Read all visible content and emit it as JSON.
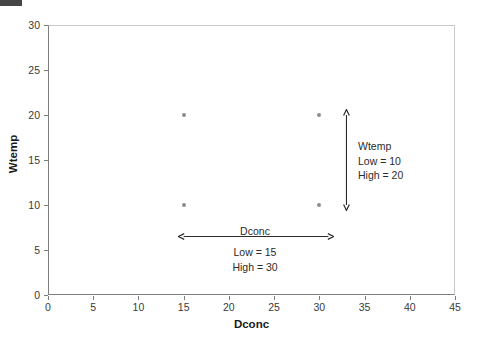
{
  "chart_data": {
    "type": "scatter",
    "title": "",
    "xlabel": "Dconc",
    "ylabel": "Wtemp",
    "xlim": [
      0,
      45
    ],
    "ylim": [
      0,
      30
    ],
    "xticks": [
      0,
      5,
      10,
      15,
      20,
      25,
      30,
      35,
      40,
      45
    ],
    "yticks": [
      0,
      5,
      10,
      15,
      20,
      25,
      30
    ],
    "grid": false,
    "legend": null,
    "marker_color": "#8d8d8d",
    "points": [
      {
        "x": 15,
        "y": 20
      },
      {
        "x": 30,
        "y": 20
      },
      {
        "x": 15,
        "y": 10
      },
      {
        "x": 30,
        "y": 10
      }
    ],
    "annotations": [
      {
        "id": "wtemp-range",
        "orientation": "vertical",
        "arrow_from": {
          "x": 33,
          "y": 20
        },
        "arrow_to": {
          "x": 33,
          "y": 10
        },
        "title": "Wtemp",
        "low_label": "Low = 10",
        "high_label": "High = 20"
      },
      {
        "id": "dconc-range",
        "orientation": "horizontal",
        "arrow_from": {
          "x": 15,
          "y": 6.5
        },
        "arrow_to": {
          "x": 31,
          "y": 6.5
        },
        "title": "Dconc",
        "low_label": "Low = 15",
        "high_label": "High = 30"
      }
    ]
  },
  "axes": {
    "x_title": "Dconc",
    "y_title": "Wtemp",
    "x_ticklabels": [
      "0",
      "5",
      "10",
      "15",
      "20",
      "25",
      "30",
      "35",
      "40",
      "45"
    ],
    "y_ticklabels": [
      "0",
      "5",
      "10",
      "15",
      "20",
      "25",
      "30"
    ]
  },
  "annotations": {
    "wtemp": {
      "title": "Wtemp",
      "low": "Low = 10",
      "high": "High = 20"
    },
    "dconc": {
      "title": "Dconc",
      "low": "Low = 15",
      "high": "High = 30"
    }
  }
}
